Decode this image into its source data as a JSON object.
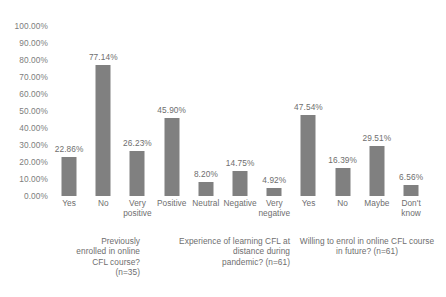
{
  "chart_data": {
    "type": "bar",
    "title": "",
    "subtitle": "",
    "xlabel": "",
    "ylabel": "",
    "ylim": [
      0,
      100
    ],
    "grid": false,
    "legend": "none",
    "orientation": "vertical",
    "bar_color": "#808080",
    "text_color": "#595959",
    "background": "#ffffff",
    "value_label_format": "0.00%",
    "categories": [
      "Yes",
      "No",
      "Very positive",
      "Positive",
      "Neutral",
      "Negative",
      "Very negative",
      "Yes",
      "No",
      "Maybe",
      "Don't know"
    ],
    "values": [
      22.86,
      77.14,
      26.23,
      45.9,
      8.2,
      14.75,
      4.92,
      47.54,
      16.39,
      29.51,
      6.56
    ],
    "value_labels": [
      "22.86%",
      "77.14%",
      "26.23%",
      "45.90%",
      "8.20%",
      "14.75%",
      "4.92%",
      "47.54%",
      "16.39%",
      "29.51%",
      "6.56%"
    ],
    "category_label_lines": [
      [
        "Yes"
      ],
      [
        "No"
      ],
      [
        "Very",
        "positive"
      ],
      [
        "Positive"
      ],
      [
        "Neutral"
      ],
      [
        "Negative"
      ],
      [
        "Very",
        "negative"
      ],
      [
        "Yes"
      ],
      [
        "No"
      ],
      [
        "Maybe"
      ],
      [
        "Don't",
        "know"
      ]
    ],
    "yticks": [
      0,
      10,
      20,
      30,
      40,
      50,
      60,
      70,
      80,
      90,
      100
    ],
    "ytick_labels": [
      "0.00%",
      "10.00%",
      "20.00%",
      "30.00%",
      "40.00%",
      "50.00%",
      "60.00%",
      "70.00%",
      "80.00%",
      "90.00%",
      "100.00%"
    ],
    "groups": [
      {
        "caption": "Previously enrolled in online CFL course? (n=35)",
        "caption_lines": [
          "Previously",
          "enrolled in online",
          "CFL course?",
          "(n=35)"
        ],
        "n": 35,
        "category_indices": [
          0,
          1
        ]
      },
      {
        "caption": "Experience of learning CFL at distance during pandemic? (n=61)",
        "caption_lines": [
          "Experience of learning CFL at",
          "distance during",
          "pandemic? (n=61)"
        ],
        "n": 61,
        "category_indices": [
          2,
          3,
          4,
          5,
          6
        ]
      },
      {
        "caption": "Willing to enrol in online CFL course in future? (n=61)",
        "caption_lines": [
          "Willing to enrol in online CFL course",
          "in future? (n=61)"
        ],
        "n": 61,
        "category_indices": [
          7,
          8,
          9,
          10
        ]
      }
    ]
  }
}
